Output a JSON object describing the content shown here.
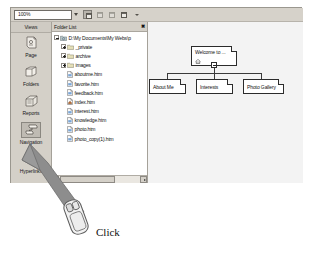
{
  "app": {
    "toolbar": {
      "zoom_value": "100%",
      "zoom_placeholder": "100%",
      "icons": [
        "page-preview-icon",
        "refresh-icon",
        "zoom-fit-icon",
        "print-preview-icon",
        "overflow-chevron-icon"
      ]
    }
  },
  "views": {
    "title": "Views",
    "items": [
      {
        "label": "Page",
        "icon": "page-view-icon",
        "active": false
      },
      {
        "label": "Folders",
        "icon": "folders-view-icon",
        "active": false
      },
      {
        "label": "Reports",
        "icon": "reports-view-icon",
        "active": false
      },
      {
        "label": "Navigation",
        "icon": "navigation-view-icon",
        "active": true
      },
      {
        "label": "Hyperlinks",
        "icon": "hyperlinks-view-icon",
        "active": false
      }
    ]
  },
  "folder_list": {
    "title": "Folder List",
    "close_label": "✖",
    "root": {
      "label": "D:\\My Documents\\My Webs\\p",
      "icon": "web-folder-icon",
      "expander": "minus"
    },
    "nodes": [
      {
        "label": "_private",
        "icon": "folder-icon",
        "expander": "plus",
        "type": "folder"
      },
      {
        "label": "archive",
        "icon": "folder-icon",
        "expander": "plus",
        "type": "folder"
      },
      {
        "label": "images",
        "icon": "folder-icon",
        "expander": "plus",
        "type": "folder"
      },
      {
        "label": "aboutme.htm",
        "icon": "html-file-icon",
        "expander": "none",
        "type": "file"
      },
      {
        "label": "favorite.htm",
        "icon": "html-file-icon",
        "expander": "none",
        "type": "file"
      },
      {
        "label": "feedback.htm",
        "icon": "html-file-icon",
        "expander": "none",
        "type": "file"
      },
      {
        "label": "index.htm",
        "icon": "home-html-file-icon",
        "expander": "none",
        "type": "file"
      },
      {
        "label": "interest.htm",
        "icon": "html-file-icon",
        "expander": "none",
        "type": "file"
      },
      {
        "label": "knowledge.htm",
        "icon": "html-file-icon",
        "expander": "none",
        "type": "file"
      },
      {
        "label": "photo.htm",
        "icon": "html-file-icon",
        "expander": "none",
        "type": "file"
      },
      {
        "label": "photo_copy(1).htm",
        "icon": "html-file-icon",
        "expander": "none",
        "type": "file"
      }
    ]
  },
  "navigation": {
    "root": {
      "label": "Welcome to ...",
      "home_icon": "home-icon",
      "collapse_label": "-"
    },
    "children": [
      {
        "label": "About Me"
      },
      {
        "label": "Interests"
      },
      {
        "label": "Photo Gallery"
      }
    ]
  },
  "annotation": {
    "click_label": "Click",
    "pointer_icon": "mouse-device-icon",
    "arrow_icon": "callout-arrow-icon"
  },
  "colors": {
    "window_face": "#d4d0c8",
    "pane_white": "#ffffff",
    "canvas": "#f3f3f3",
    "arrow": "#8d8d8d",
    "text": "#111111"
  }
}
